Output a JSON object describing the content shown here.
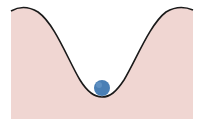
{
  "diagram": {
    "colors": {
      "background": "#ffffff",
      "well_fill": "#f0d6d2",
      "curve_stroke": "#1a1a1a",
      "ball": "#4a7fb5"
    },
    "elements": [
      {
        "name": "potential-well",
        "type": "curve"
      },
      {
        "name": "ball",
        "type": "circle"
      }
    ]
  }
}
